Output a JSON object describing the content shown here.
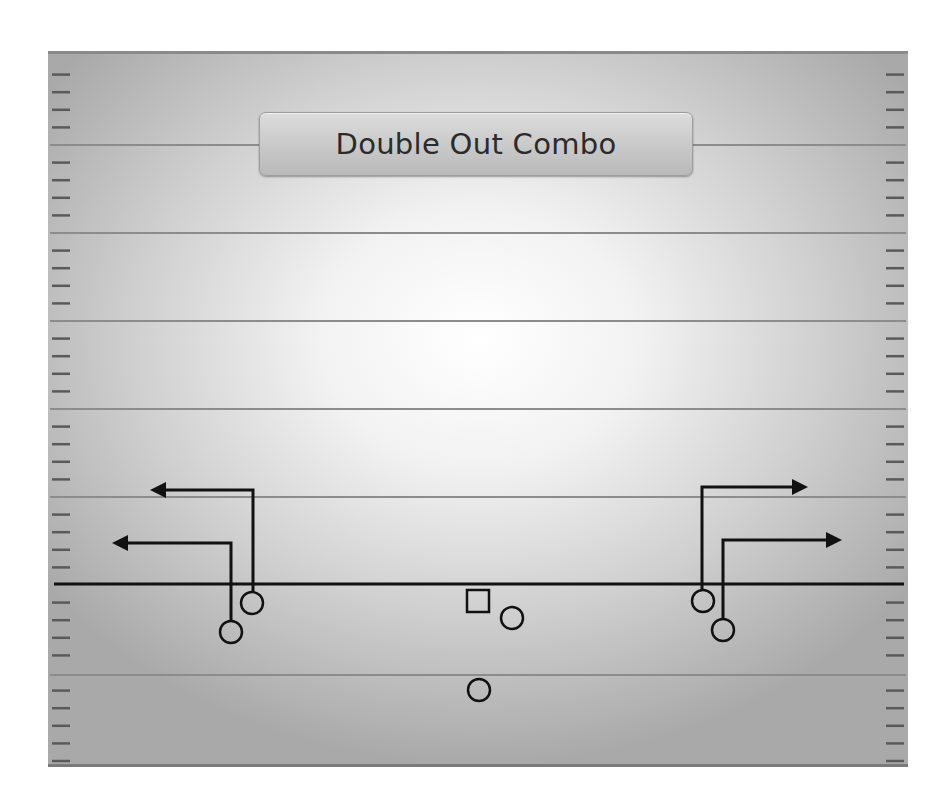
{
  "title": "Double Out Combo",
  "colors": {
    "line": "#111111",
    "yard_line": "#8c8c8c",
    "hash": "#5a5a5a",
    "title_text": "#2b2b2b"
  },
  "field": {
    "yard_lines_y": [
      145,
      233,
      321,
      409,
      497,
      675
    ],
    "line_of_scrimmage_y": 584
  },
  "players": {
    "center": {
      "shape": "square",
      "x": 478,
      "y": 601,
      "size": 22
    },
    "offense": [
      {
        "id": "left-wr",
        "shape": "circle",
        "x": 231,
        "y": 632
      },
      {
        "id": "left-slot",
        "shape": "circle",
        "x": 252,
        "y": 603
      },
      {
        "id": "guard-rb",
        "shape": "circle",
        "x": 512,
        "y": 618
      },
      {
        "id": "qb",
        "shape": "circle",
        "x": 479,
        "y": 690
      },
      {
        "id": "right-slot",
        "shape": "circle",
        "x": 703,
        "y": 601
      },
      {
        "id": "right-wr",
        "shape": "circle",
        "x": 723,
        "y": 630
      }
    ]
  },
  "routes": [
    {
      "id": "left-wr-out",
      "points": [
        [
          231,
          620
        ],
        [
          231,
          543
        ],
        [
          124,
          543
        ]
      ],
      "direction": "left"
    },
    {
      "id": "left-slot-out",
      "points": [
        [
          253,
          591
        ],
        [
          253,
          490
        ],
        [
          162,
          490
        ]
      ],
      "direction": "left"
    },
    {
      "id": "right-slot-out",
      "points": [
        [
          702,
          589
        ],
        [
          702,
          487
        ],
        [
          796,
          487
        ]
      ],
      "direction": "right"
    },
    {
      "id": "right-wr-out",
      "points": [
        [
          723,
          618
        ],
        [
          723,
          540
        ],
        [
          830,
          540
        ]
      ],
      "direction": "right"
    }
  ]
}
